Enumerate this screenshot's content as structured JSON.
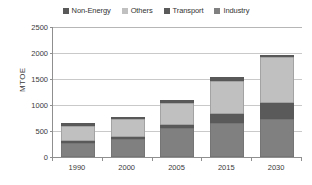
{
  "chart_data": {
    "type": "bar",
    "stacked": true,
    "title": "",
    "xlabel": "",
    "ylabel": "MTOE",
    "ylim": [
      0,
      2500
    ],
    "yticks": [
      0,
      500,
      1000,
      1500,
      2000,
      2500
    ],
    "ytick_labels": [
      "0",
      "500",
      "1000",
      "1500",
      "2000",
      "2500"
    ],
    "grid": true,
    "legend_position": "top-center",
    "categories": [
      "1990",
      "2000",
      "2005",
      "2015",
      "2030"
    ],
    "series": [
      {
        "name": "Industry",
        "color": "#808080",
        "values": [
          270,
          345,
          560,
          660,
          730
        ]
      },
      {
        "name": "Transport",
        "color": "#5a5a5a",
        "values": [
          45,
          35,
          55,
          175,
          300
        ]
      },
      {
        "name": "Others",
        "color": "#c0c0c0",
        "values": [
          290,
          350,
          425,
          635,
          885
        ]
      },
      {
        "name": "Non-Energy",
        "color": "#595959",
        "values": [
          45,
          40,
          50,
          60,
          55
        ]
      }
    ],
    "totals": [
      650,
      770,
      1090,
      1530,
      1970
    ]
  },
  "legend": {
    "items": [
      {
        "label": "Non-Energy",
        "color": "#595959"
      },
      {
        "label": "Others",
        "color": "#c0c0c0"
      },
      {
        "label": "Transport",
        "color": "#5a5a5a"
      },
      {
        "label": "Industry",
        "color": "#808080"
      }
    ]
  }
}
